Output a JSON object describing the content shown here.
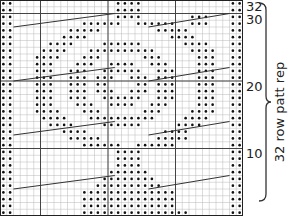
{
  "chart": {
    "columns": 36,
    "rows": 32,
    "symbol_purl": "dot",
    "grid_color": "#b8b8b8",
    "major_grid_color": "#444444",
    "dot_color": "#111111",
    "cable_line_color": "#333333",
    "pattern": [
      "**...............****.............**",
      "**...............****.............**",
      "**...............****.......***...**",
      "**..........******..******..***...**",
      "**........*****........*****......**",
      "**.......****............****.....**",
      "**.....****....******......****...**",
      "**....****...**********.....****..**",
      "**...****...***......***.....***..**",
      "**...***...***..****..***....***..**",
      "**...***..***..******..***...***..**",
      "**...***..***.***..***.***...***..**",
      "**...***..***.**....**.***...***..**",
      "**...***..***.***..***.***...***..**",
      "**...***..***..******..***...***..**",
      "**...***...***..****..***....***..**",
      "**...****...***......***....****..**",
      "**....****...**********....****...**",
      "**.....****....******.....****....**",
      "**.......****...........****......**",
      "**........*****........*****......**",
      "**..........******..******........**",
      "**...............****.............**",
      "**...............****.............**",
      "**...............****.............**",
      "**..............******............**",
      "**.............********...........**",
      "**............**********..........**",
      "**..........**************........**",
      "**..........**************........**",
      "**..........**************........**",
      "**..........****************......**"
    ]
  },
  "row_labels": [
    {
      "text": "32",
      "row": 32
    },
    {
      "text": "30",
      "row": 30
    },
    {
      "text": "20",
      "row": 20
    },
    {
      "text": "10",
      "row": 10
    }
  ],
  "repeat_label": "32 row patt rep"
}
